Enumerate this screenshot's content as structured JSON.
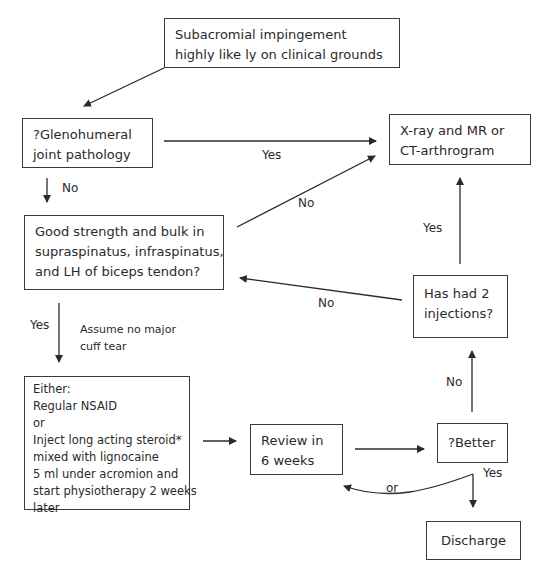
{
  "nodes": {
    "start": {
      "lines": [
        "Subacromial impingement",
        "highly like  ly on clinical grounds"
      ]
    },
    "glenohumeral": {
      "lines": [
        "?Glenohumeral",
        "joint pathology"
      ]
    },
    "imaging": {
      "lines": [
        "X-ray and MR or",
        "CT-arthrogram"
      ]
    },
    "strength": {
      "lines": [
        "Good strength and bulk in",
        "supraspinatus, infraspinatus,",
        "and LH of biceps tendon?"
      ]
    },
    "injections": {
      "lines": [
        "Has had 2",
        "injections?"
      ]
    },
    "treatment": {
      "lines": [
        "Either:",
        "Regular NSAID",
        "or",
        "Inject long acting steroid*",
        "mixed with lignocaine",
        "5 ml under acromion and",
        "start physiotherapy 2 weeks",
        "later"
      ]
    },
    "review": {
      "lines": [
        "Review in",
        "6 weeks"
      ]
    },
    "better": {
      "lines": [
        "?Better"
      ]
    },
    "discharge": {
      "lines": [
        "Discharge"
      ]
    }
  },
  "edge_labels": {
    "glenohumeral_yes": "Yes",
    "glenohumeral_no": "No",
    "strength_no": "No",
    "strength_yes": "Yes",
    "assume": [
      "Assume no major",
      "cuff tear"
    ],
    "injections_yes": "Yes",
    "injections_no": "No",
    "better_no": "No",
    "better_yes": "Yes",
    "better_or": "or"
  },
  "colors": {
    "stroke": "#2a2a2a",
    "background": "#ffffff"
  }
}
